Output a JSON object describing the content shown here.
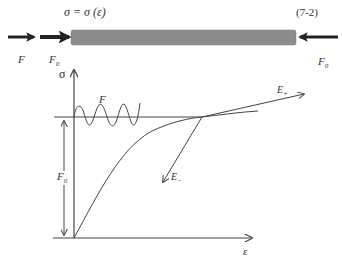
{
  "header": {
    "equation": "σ = σ (ε)",
    "equation_number": "(7-2)"
  },
  "bar_diagram": {
    "bar_color": "#8c8c8c",
    "force_left_outer": "F",
    "force_left_inner": "F",
    "force_left_inner_sub": "0",
    "force_right": "F",
    "force_right_sub": "0"
  },
  "graph": {
    "y_axis_label": "σ",
    "x_axis_label": "ε",
    "oscillation_label": "F",
    "preload_label": "F",
    "preload_sub": "0",
    "tangent_plus_label": "E",
    "tangent_plus_sub": "+",
    "tangent_minus_label": "E",
    "tangent_minus_sub": "−",
    "line_color": "#444444"
  }
}
